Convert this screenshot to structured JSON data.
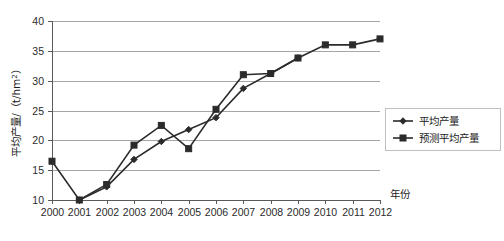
{
  "chart_data": {
    "type": "line",
    "title": "",
    "xlabel": "年份",
    "ylabel": "平均产量/（t/hm²）",
    "ylabel_main": "平均产量/（t/hm",
    "ylabel_sup": "2",
    "ylabel_tail": "）",
    "grid": true,
    "legend_position": "right",
    "categories": [
      "2000",
      "2001",
      "2002",
      "2003",
      "2004",
      "2005",
      "2006",
      "2007",
      "2008",
      "2009",
      "2010",
      "2011",
      "2012"
    ],
    "x": [
      2000,
      2001,
      2002,
      2003,
      2004,
      2005,
      2006,
      2007,
      2008,
      2009,
      2010,
      2011,
      2012
    ],
    "xlim": [
      2000,
      2012
    ],
    "ylim": [
      10,
      40
    ],
    "ytick_labels": [
      "10",
      "15",
      "20",
      "25",
      "30",
      "35",
      "40"
    ],
    "yticks": [
      10,
      15,
      20,
      25,
      30,
      35,
      40
    ],
    "series": [
      {
        "name": "平均产量",
        "marker": "diamond",
        "color": "#2b2b2b",
        "x": [
          2001,
          2002,
          2003,
          2004,
          2005,
          2006,
          2007,
          2008,
          2009
        ],
        "values": [
          10.0,
          12.2,
          16.8,
          19.8,
          21.8,
          23.8,
          28.7,
          31.2,
          33.8
        ]
      },
      {
        "name": "预测平均产量",
        "marker": "square",
        "color": "#2b2b2b",
        "x": [
          2000,
          2001,
          2002,
          2003,
          2004,
          2005,
          2006,
          2007,
          2008,
          2009,
          2010,
          2011,
          2012
        ],
        "values": [
          16.5,
          10.0,
          12.6,
          19.2,
          22.5,
          18.6,
          25.2,
          31.0,
          31.2,
          33.8,
          36.0,
          36.0,
          37.0
        ]
      }
    ],
    "legend": [
      {
        "label": "平均产量",
        "marker": "diamond"
      },
      {
        "label": "预测平均产量",
        "marker": "square"
      }
    ]
  }
}
